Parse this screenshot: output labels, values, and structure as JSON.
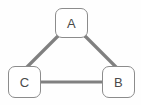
{
  "diagram": {
    "background_color": "#fefefe",
    "node_fill_color": "#ffffff",
    "node_border_color": "#8c8c8c",
    "edge_color": "#808080",
    "label_color": "#4a4a4a",
    "nodes": [
      {
        "id": "A",
        "label": "A",
        "x": 71.5,
        "y": 23.0
      },
      {
        "id": "C",
        "label": "C",
        "x": 24.5,
        "y": 82.0
      },
      {
        "id": "B",
        "label": "B",
        "x": 118.5,
        "y": 82.0
      }
    ],
    "edges": [
      {
        "id": "edge-a-c",
        "from": "A",
        "to": "C",
        "directed": false,
        "label": ""
      },
      {
        "id": "edge-a-b",
        "from": "A",
        "to": "B",
        "directed": false,
        "label": ""
      },
      {
        "id": "edge-c-b",
        "from": "C",
        "to": "B",
        "directed": false,
        "label": ""
      }
    ]
  }
}
